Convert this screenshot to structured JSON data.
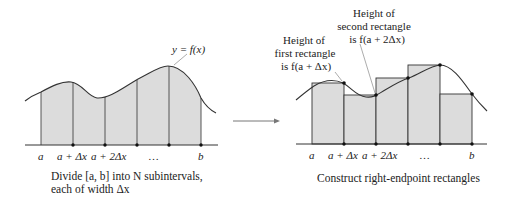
{
  "left_panel": {
    "curve_label": "y = f(x)",
    "tick_labels": [
      "a",
      "a + Δx",
      "a + 2Δx",
      "…",
      "b"
    ],
    "caption_line1": "Divide [a, b] into N subintervals,",
    "caption_line2": "each of width Δx"
  },
  "right_panel": {
    "annotation_first": [
      "Height of",
      "first rectangle",
      "is f(a + Δx)"
    ],
    "annotation_second": [
      "Height of",
      "second rectangle",
      "is f(a + 2Δx)"
    ],
    "tick_labels": [
      "a",
      "a + Δx",
      "a + 2Δx",
      "…",
      "b"
    ],
    "caption": "Construct right-endpoint rectangles"
  },
  "colors": {
    "fill": "#dcdcdc",
    "stroke": "#333333",
    "leader": "#888888"
  }
}
